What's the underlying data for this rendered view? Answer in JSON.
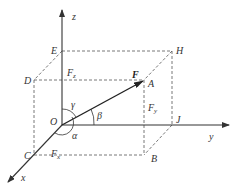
{
  "diagram": {
    "axes": {
      "x": "x",
      "y": "y",
      "z": "z"
    },
    "origin": "O",
    "points": {
      "E": "E",
      "D": "D",
      "H": "H",
      "A": "A",
      "J": "J",
      "B": "B",
      "C": "C"
    },
    "force": {
      "label": "F"
    },
    "components": {
      "fx": "F",
      "fx_sub": "x",
      "fy": "F",
      "fy_sub": "y",
      "fz": "F",
      "fz_sub": "z"
    },
    "angles": {
      "alpha": "α",
      "beta": "β",
      "gamma": "γ"
    },
    "colors": {
      "line": "#333333",
      "dashed": "#555555",
      "background": "#ffffff"
    }
  }
}
